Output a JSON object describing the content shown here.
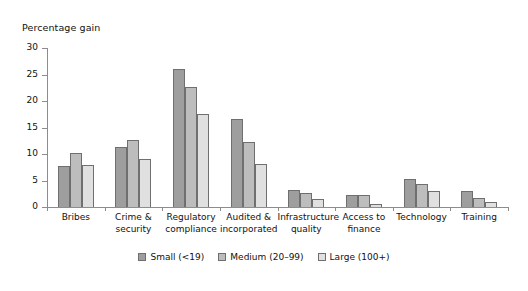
{
  "chart_data": {
    "type": "bar",
    "title": "",
    "ylabel": "Percentage gain",
    "xlabel": "",
    "ylim": [
      0,
      30
    ],
    "yticks": [
      0,
      5,
      10,
      15,
      20,
      25,
      30
    ],
    "grid": false,
    "legend_position": "bottom-center",
    "categories": [
      "Bribes",
      "Crime &\nsecurity",
      "Regulatory\ncompliance",
      "Audited &\nincorporated",
      "Infrastructure\nquality",
      "Access to\nfinance",
      "Technology",
      "Training"
    ],
    "series": [
      {
        "name": "Small (<19)",
        "color": "#9e9e9e",
        "values": [
          7.7,
          11.4,
          26.0,
          16.6,
          3.2,
          2.2,
          5.3,
          3.1
        ]
      },
      {
        "name": "Medium (20–99)",
        "color": "#bdbdbd",
        "values": [
          10.2,
          12.6,
          22.6,
          12.3,
          2.6,
          2.2,
          4.3,
          1.7
        ]
      },
      {
        "name": "Large (100+)",
        "color": "#e0e0e0",
        "values": [
          8.0,
          9.0,
          17.5,
          8.2,
          1.5,
          0.6,
          3.1,
          0.9
        ]
      }
    ]
  }
}
